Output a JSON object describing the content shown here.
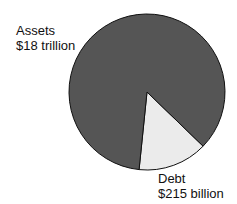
{
  "chart_data": {
    "type": "pie",
    "title": "",
    "slices": [
      {
        "name": "Assets",
        "value_label": "$18 trillion",
        "value": 18000000000000,
        "color": "#555555"
      },
      {
        "name": "Debt",
        "value_label": "$215 billion",
        "value": 215000000000,
        "color": "#ebebeb"
      }
    ],
    "units": "USD",
    "legend": "none (direct labels)",
    "drawn_to_scale": false,
    "scale_note": "Labeled values imply Debt is ~1.2% of the total ($215B of ~$18.2T), but the wedge as drawn spans ~52 degrees (~14% of the circle). The figure exaggerates the Debt slice; slice sizes do not reflect the data.",
    "display_fractions_as_drawn": {
      "Debt": 0.144,
      "Assets": 0.856
    },
    "debt_wedge_start_angle_deg": 44
  },
  "labels": {
    "assets_name": "Assets",
    "assets_value": "$18 trillion",
    "debt_name": "Debt",
    "debt_value": "$215 billion"
  },
  "colors": {
    "outline": "#111111"
  }
}
